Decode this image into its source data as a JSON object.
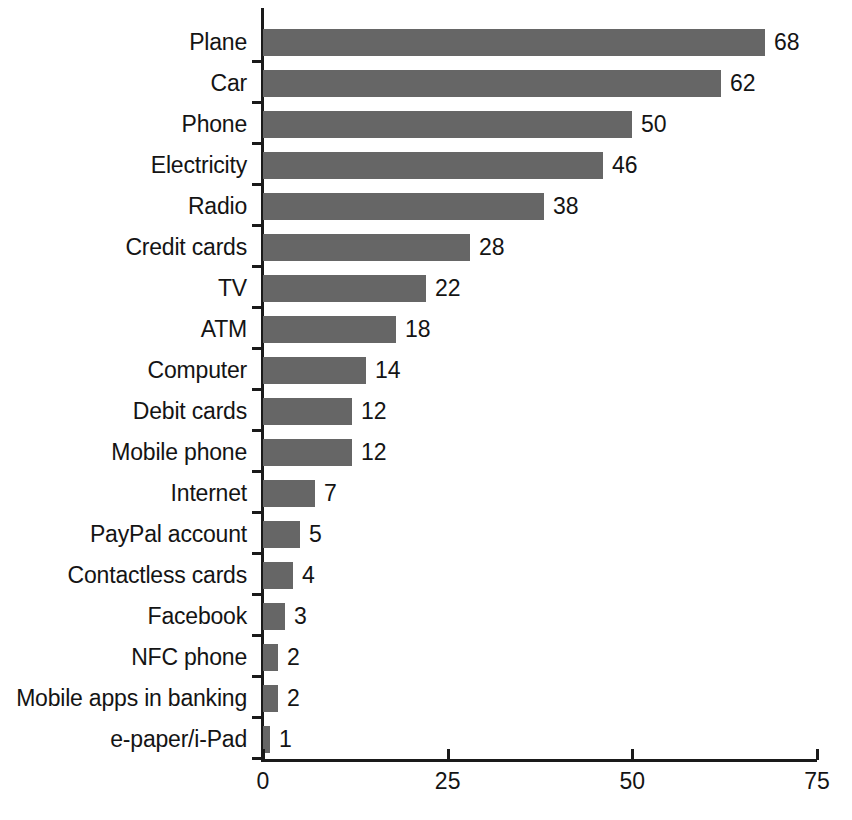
{
  "chart_data": {
    "type": "bar",
    "orientation": "horizontal",
    "title": "",
    "subtitle": "",
    "xlabel": "",
    "ylabel": "",
    "xlim": [
      0,
      75
    ],
    "xticks": [
      0,
      25,
      50,
      75
    ],
    "xtick_labels": [
      "0",
      "25",
      "50",
      "75"
    ],
    "grid": false,
    "legend": false,
    "bar_color": "#666666",
    "axis_color": "#1a1a1a",
    "text_color": "#141414",
    "show_value_labels": true,
    "categories": [
      "Plane",
      "Car",
      "Phone",
      "Electricity",
      "Radio",
      "Credit cards",
      "TV",
      "ATM",
      "Computer",
      "Debit cards",
      "Mobile phone",
      "Internet",
      "PayPal account",
      "Contactless cards",
      "Facebook",
      "NFC phone",
      "Mobile apps in banking",
      "e-paper/i-Pad"
    ],
    "values": [
      68,
      62,
      50,
      46,
      38,
      28,
      22,
      18,
      14,
      12,
      12,
      7,
      5,
      4,
      3,
      2,
      2,
      1
    ],
    "value_labels": [
      "68",
      "62",
      "50",
      "46",
      "38",
      "28",
      "22",
      "18",
      "14",
      "12",
      "12",
      "7",
      "5",
      "4",
      "3",
      "2",
      "2",
      "1"
    ]
  }
}
